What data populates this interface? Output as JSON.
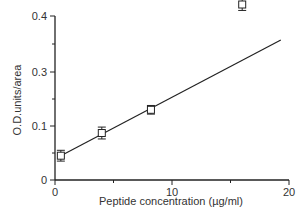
{
  "chart_data": {
    "type": "scatter",
    "title": "",
    "xlabel": "Peptide concentration (µg/ml)",
    "ylabel": "O.D.units/area",
    "xlim": [
      0,
      20
    ],
    "ylim": [
      0,
      0.4
    ],
    "grid": false,
    "legend": null,
    "x_ticks": [
      {
        "value": 0,
        "label": "0"
      },
      {
        "value": 10,
        "label": "10"
      },
      {
        "value": 20,
        "label": "20"
      }
    ],
    "x_minor_ticks": [
      5,
      15
    ],
    "y_ticks": [
      {
        "label": "0",
        "py": 180
      },
      {
        "label": "0.1",
        "py": 126
      },
      {
        "label": "0.3",
        "py": 72
      },
      {
        "label": "0.4",
        "py": 16
      }
    ],
    "y_minor_ticks_py": [
      153,
      99,
      44
    ],
    "series": [
      {
        "name": "Peptide",
        "marker": "open-square",
        "error_bars": true,
        "points": [
          {
            "x": 0.5,
            "y": 0.045,
            "err": 0.01
          },
          {
            "x": 4.0,
            "y": 0.087,
            "err": 0.011
          },
          {
            "x": 8.2,
            "y": 0.13,
            "err": 0.008
          },
          {
            "x": 16.0,
            "y": 0.325,
            "err": 0.011
          }
        ]
      }
    ],
    "fit_line": {
      "type": "linear",
      "x_start": 0.5,
      "x_end": 19.3,
      "y_start": 0.045,
      "y_end": 0.36
    }
  },
  "labels": {
    "xlabel": "Peptide concentration (µg/ml)",
    "ylabel": "O.D.units/area"
  },
  "colors": {
    "axis": "#222222",
    "line": "#222222",
    "text": "#333333",
    "background": "#ffffff"
  }
}
